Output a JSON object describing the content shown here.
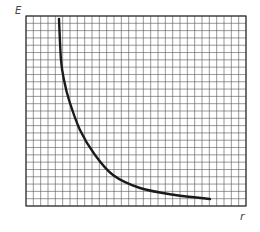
{
  "chart_data": {
    "type": "line",
    "title": "",
    "xlabel": "r",
    "ylabel": "E",
    "grid": true,
    "grid_cells": {
      "columns": 30,
      "rows": 26
    },
    "axis_ticks": "none (no numeric tick labels shown)",
    "series": [
      {
        "name": "E(r)",
        "x_grid_units": [
          4.5,
          4.8,
          5.2,
          5.8,
          7.4,
          9.4,
          11.9,
          15.6,
          20.4,
          25.2
        ],
        "y_grid_units": [
          25.6,
          20.0,
          17.3,
          14.5,
          10.4,
          7.0,
          4.3,
          2.5,
          1.5,
          1.0
        ],
        "pixel_points": [
          [
            59,
            19
          ],
          [
            61,
            60
          ],
          [
            64,
            80
          ],
          [
            69,
            100
          ],
          [
            80,
            130
          ],
          [
            95,
            155
          ],
          [
            113,
            175
          ],
          [
            140,
            188
          ],
          [
            175,
            195
          ],
          [
            210,
            199
          ]
        ]
      }
    ],
    "legend": null
  },
  "labels": {
    "y_axis": "E",
    "x_axis": "r"
  },
  "style": {
    "grid_color": "#555555",
    "curve_color": "#1a1a1a",
    "background": "#ffffff"
  },
  "plot_area": {
    "left": 26,
    "top": 16,
    "right": 246,
    "bottom": 206
  }
}
